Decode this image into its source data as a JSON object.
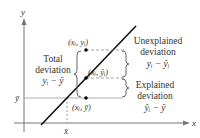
{
  "diagram": {
    "type": "regression-deviation-diagram",
    "axes": {
      "x_label": "x",
      "y_label": "y",
      "x_mean_label": "x̄",
      "y_mean_label": "ȳ"
    },
    "points": [
      {
        "label": "(x",
        "sub": "i",
        "mid": ", y",
        "sub2": "i",
        "end": ")",
        "full": "(xᵢ, yᵢ)"
      },
      {
        "label": "(x",
        "sub": "i",
        "mid": ", ŷ",
        "sub2": "i",
        "end": ")",
        "full": "(xᵢ, ŷᵢ)"
      },
      {
        "label": "(x",
        "sub": "i",
        "mid": ", ȳ",
        "end": ")",
        "full": "(xᵢ, ȳ)"
      }
    ],
    "total_deviation": {
      "line1": "Total",
      "line2": "deviation",
      "formula": "yᵢ − ȳ"
    },
    "unexplained_deviation": {
      "line1": "Unexplained",
      "line2": "deviation",
      "formula": "yᵢ − ŷᵢ"
    },
    "explained_deviation": {
      "line1": "Explained",
      "line2": "deviation",
      "formula": "ŷᵢ − ȳ"
    },
    "colors": {
      "axis": "#777777",
      "regression_line": "#111111",
      "dashed": "#888888",
      "text": "#333333",
      "point": "#000000"
    }
  }
}
